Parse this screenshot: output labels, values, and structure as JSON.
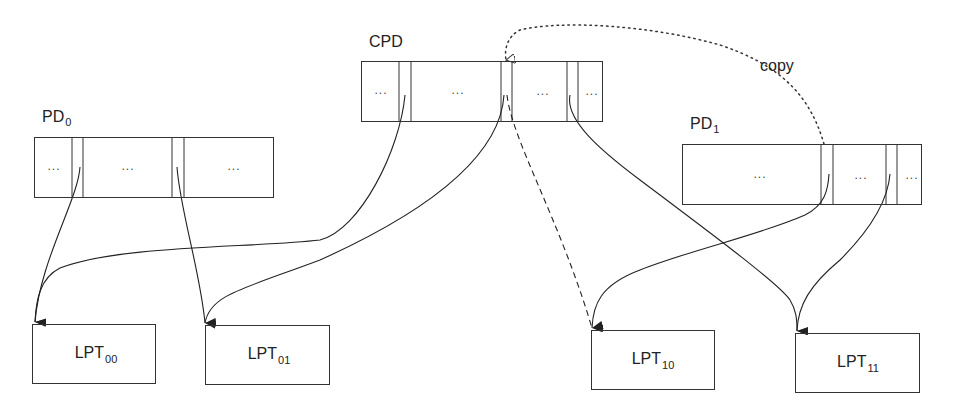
{
  "diagram": {
    "type": "page-directory-copy-schematic",
    "tables": {
      "cpd": {
        "label": "CPD",
        "sub": "",
        "cells": [
          "...",
          "...",
          "...",
          "..."
        ]
      },
      "pd0": {
        "label": "PD",
        "sub": "0",
        "cells": [
          "...",
          "...",
          "..."
        ]
      },
      "pd1": {
        "label": "PD",
        "sub": "1",
        "cells": [
          "...",
          "...",
          "..."
        ]
      }
    },
    "leaves": {
      "lpt00": {
        "label": "LPT",
        "sub": "00"
      },
      "lpt01": {
        "label": "LPT",
        "sub": "01"
      },
      "lpt10": {
        "label": "LPT",
        "sub": "10"
      },
      "lpt11": {
        "label": "LPT",
        "sub": "11"
      }
    },
    "annotations": {
      "copy": "copy"
    },
    "edges": [
      {
        "from": "pd0.entry0",
        "to": "lpt00",
        "style": "solid"
      },
      {
        "from": "pd0.entry1",
        "to": "lpt01",
        "style": "solid"
      },
      {
        "from": "cpd.entry0",
        "to": "lpt00",
        "style": "solid"
      },
      {
        "from": "cpd.entry1",
        "to": "lpt01",
        "style": "solid"
      },
      {
        "from": "cpd.entry1",
        "to": "lpt10",
        "style": "dashed"
      },
      {
        "from": "cpd.entry2",
        "to": "lpt11",
        "style": "solid"
      },
      {
        "from": "pd1.entry0",
        "to": "lpt10",
        "style": "solid"
      },
      {
        "from": "pd1.entry1",
        "to": "lpt11",
        "style": "solid"
      },
      {
        "from": "pd1.entry0",
        "to": "cpd.entry1",
        "style": "dotted",
        "label": "copy"
      }
    ]
  }
}
